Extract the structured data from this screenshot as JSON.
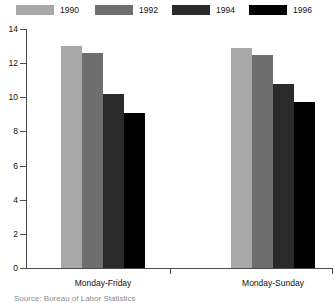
{
  "chart_data": {
    "type": "bar",
    "title": "",
    "subtitle": "",
    "xlabel": "",
    "ylabel": "",
    "categories": [
      "Monday-Friday",
      "Monday-Sunday"
    ],
    "series": [
      {
        "name": "1990",
        "color": "#a8a8a8",
        "values": [
          13.0,
          12.9
        ]
      },
      {
        "name": "1992",
        "color": "#6e6e6e",
        "values": [
          12.6,
          12.5
        ]
      },
      {
        "name": "1994",
        "color": "#2a2a2a",
        "values": [
          10.2,
          10.8
        ]
      },
      {
        "name": "1996",
        "color": "#000000",
        "values": [
          9.1,
          9.7
        ]
      }
    ],
    "ylim": [
      0,
      14
    ],
    "yticks": [
      0,
      2,
      4,
      6,
      8,
      10,
      12,
      14
    ],
    "ytick_labels": [
      "0",
      "2",
      "4",
      "6",
      "8",
      "10",
      "12",
      "14"
    ],
    "grid": false,
    "legend_position": "top"
  },
  "legend": {
    "items": [
      {
        "label": "1990",
        "swatch_name": "legend-swatch-1990"
      },
      {
        "label": "1992",
        "swatch_name": "legend-swatch-1992"
      },
      {
        "label": "1994",
        "swatch_name": "legend-swatch-1994"
      },
      {
        "label": "1996",
        "swatch_name": "legend-swatch-1996"
      }
    ]
  },
  "axes": {
    "y_tick_labels": [
      "14",
      "12",
      "10",
      "8",
      "6",
      "4",
      "2",
      "0"
    ],
    "x_category_labels": [
      "Monday-Friday",
      "Monday-Sunday"
    ]
  },
  "footer": {
    "caption_fragment": "Source: Bureau of Labor Statistics"
  },
  "colors": {
    "axis": "#4d4d4d",
    "text": "#111111",
    "background": "#ffffff"
  }
}
